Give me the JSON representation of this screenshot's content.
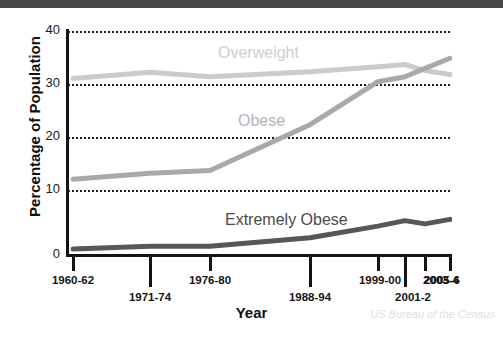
{
  "figure": {
    "background_color": "#ffffff",
    "topbar_color": "#474747",
    "attribution": "US Bureau of the Census"
  },
  "axis": {
    "ylabel": "Percentage of Population",
    "xlabel": "Year",
    "yticks": [
      "40",
      "30",
      "20",
      "10",
      "0"
    ]
  },
  "series_labels": {
    "overweight": "Overweight",
    "obese": "Obese",
    "extremely_obese": "Extremely Obese"
  },
  "chart_data": {
    "type": "line",
    "title": "",
    "xlabel": "Year",
    "ylabel": "Percentage of Population",
    "ylim": [
      0,
      40
    ],
    "yticks": [
      0,
      10,
      20,
      30,
      40
    ],
    "grid": true,
    "legend_position": "inline-labels",
    "categories": [
      "1960-62",
      "1971-74",
      "1976-80",
      "1988-94",
      "1999-00",
      "2001-2",
      "2003-4",
      "2005-6"
    ],
    "series": [
      {
        "name": "Overweight",
        "color": "#cbcbcb",
        "values": [
          31.5,
          32.6,
          31.8,
          32.7,
          33.6,
          34.0,
          32.9,
          32.2
        ]
      },
      {
        "name": "Obese",
        "color": "#a9a9a9",
        "values": [
          13.4,
          14.5,
          15.0,
          23.2,
          30.9,
          31.8,
          33.3,
          35.1
        ]
      },
      {
        "name": "Extremely Obese",
        "color": "#575757",
        "values": [
          0.9,
          1.4,
          1.4,
          2.9,
          5.0,
          6.0,
          5.4,
          6.2
        ]
      }
    ],
    "annotations": [
      "US Bureau of the Census"
    ]
  }
}
